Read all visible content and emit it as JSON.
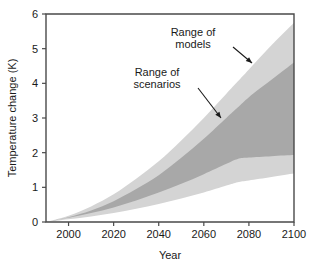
{
  "chart_data": {
    "type": "area",
    "title": "",
    "xlabel": "Year",
    "ylabel": "Temperature change (K)",
    "xlim": [
      1990,
      2100
    ],
    "ylim": [
      0,
      6
    ],
    "grid": false,
    "legend_position": "none",
    "xticks": [
      2000,
      2020,
      2040,
      2060,
      2080,
      2100
    ],
    "yticks": [
      0,
      1,
      2,
      3,
      4,
      5,
      6
    ],
    "x": [
      1990,
      2000,
      2010,
      2020,
      2030,
      2040,
      2050,
      2060,
      2070,
      2075,
      2080,
      2090,
      2100
    ],
    "bands": [
      {
        "name": "Range of models",
        "fill": "#d4d4d4",
        "upper": [
          0.0,
          0.18,
          0.45,
          0.8,
          1.25,
          1.75,
          2.35,
          3.0,
          3.7,
          4.05,
          4.4,
          5.1,
          5.75
        ],
        "lower": [
          0.0,
          0.08,
          0.16,
          0.26,
          0.38,
          0.52,
          0.68,
          0.85,
          1.05,
          1.15,
          1.2,
          1.3,
          1.4
        ]
      },
      {
        "name": "Range of scenarios",
        "fill": "#a8a8a8",
        "upper": [
          0.0,
          0.14,
          0.33,
          0.6,
          0.95,
          1.35,
          1.85,
          2.4,
          3.0,
          3.3,
          3.6,
          4.1,
          4.6
        ],
        "lower": [
          0.0,
          0.12,
          0.26,
          0.42,
          0.62,
          0.85,
          1.1,
          1.38,
          1.68,
          1.82,
          1.86,
          1.9,
          1.93
        ]
      }
    ],
    "annotations": [
      {
        "id": "range-of-models",
        "line1": "Range of",
        "line2": "models",
        "text_x": 193,
        "text_y": 36,
        "arrow_from_x": 233,
        "arrow_from_y": 47,
        "arrow_to_x": 252,
        "arrow_to_y": 63
      },
      {
        "id": "range-of-scenarios",
        "line1": "Range of",
        "line2": "scenarios",
        "text_x": 157,
        "text_y": 76,
        "arrow_from_x": 198,
        "arrow_from_y": 88,
        "arrow_to_x": 221,
        "arrow_to_y": 118
      }
    ]
  },
  "axes": {
    "y_title": "Temperature change (K)",
    "x_title": "Year",
    "y_tick_labels": [
      "0",
      "1",
      "2",
      "3",
      "4",
      "5",
      "6"
    ],
    "x_tick_labels": [
      "2000",
      "2020",
      "2040",
      "2060",
      "2080",
      "2100"
    ]
  },
  "colors": {
    "band_models": "#d4d4d4",
    "band_scenarios": "#a8a8a8",
    "frame": "#4a4a4a",
    "text": "#1a1a1a",
    "background": "#ffffff"
  }
}
